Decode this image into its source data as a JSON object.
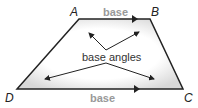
{
  "diagram": {
    "vertices": {
      "A": "A",
      "B": "B",
      "C": "C",
      "D": "D"
    },
    "top_base_label": "base",
    "bottom_base_label": "base",
    "center_label": "base angles"
  }
}
